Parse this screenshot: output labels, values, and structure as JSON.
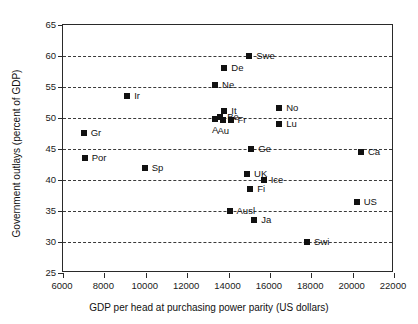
{
  "chart_data": {
    "type": "scatter",
    "title": "",
    "xlabel": "GDP per head at purchasing power parity (US dollars)",
    "ylabel": "Government outlays (percent of GDP)",
    "xlim": [
      6000,
      22000
    ],
    "ylim": [
      25,
      65
    ],
    "xticks": [
      6000,
      8000,
      10000,
      12000,
      14000,
      16000,
      18000,
      20000,
      22000
    ],
    "yticks": [
      25,
      30,
      35,
      40,
      45,
      50,
      55,
      60,
      65
    ],
    "grid": "horizontal-dashed",
    "legend": "none",
    "marker_color": "#111111",
    "points": [
      {
        "label": "Swe",
        "x": 15000,
        "y": 60.0,
        "label_pos": "right"
      },
      {
        "label": "De",
        "x": 13800,
        "y": 58.0,
        "label_pos": "right"
      },
      {
        "label": "Ne",
        "x": 13350,
        "y": 55.4,
        "label_pos": "right"
      },
      {
        "label": "Ir",
        "x": 9100,
        "y": 53.5,
        "label_pos": "right"
      },
      {
        "label": "No",
        "x": 16450,
        "y": 51.6,
        "label_pos": "right"
      },
      {
        "label": "Lu",
        "x": 16450,
        "y": 49.0,
        "label_pos": "right"
      },
      {
        "label": "It",
        "x": 13800,
        "y": 51.1,
        "label_pos": "right"
      },
      {
        "label": "Be",
        "x": 13600,
        "y": 50.2,
        "label_pos": "right"
      },
      {
        "label": "Au",
        "x": 13750,
        "y": 49.6,
        "label_pos": "below"
      },
      {
        "label": "A",
        "x": 13350,
        "y": 49.8,
        "label_pos": "below"
      },
      {
        "label": "Fr",
        "x": 14100,
        "y": 49.6,
        "label_pos": "right"
      },
      {
        "label": "Gr",
        "x": 7000,
        "y": 47.6,
        "label_pos": "right"
      },
      {
        "label": "Por",
        "x": 7050,
        "y": 43.5,
        "label_pos": "right"
      },
      {
        "label": "Sp",
        "x": 9950,
        "y": 42.0,
        "label_pos": "right"
      },
      {
        "label": "Ge",
        "x": 15100,
        "y": 45.0,
        "label_pos": "right"
      },
      {
        "label": "Ca",
        "x": 20400,
        "y": 44.5,
        "label_pos": "right"
      },
      {
        "label": "UK",
        "x": 14900,
        "y": 41.0,
        "label_pos": "right"
      },
      {
        "label": "Ice",
        "x": 15700,
        "y": 40.0,
        "label_pos": "right"
      },
      {
        "label": "Fi",
        "x": 15050,
        "y": 38.6,
        "label_pos": "right"
      },
      {
        "label": "US",
        "x": 20200,
        "y": 36.5,
        "label_pos": "right"
      },
      {
        "label": "Ausl",
        "x": 14050,
        "y": 35.0,
        "label_pos": "right"
      },
      {
        "label": "Ja",
        "x": 15250,
        "y": 33.5,
        "label_pos": "right"
      },
      {
        "label": "Swi",
        "x": 17800,
        "y": 30.0,
        "label_pos": "right"
      }
    ]
  }
}
